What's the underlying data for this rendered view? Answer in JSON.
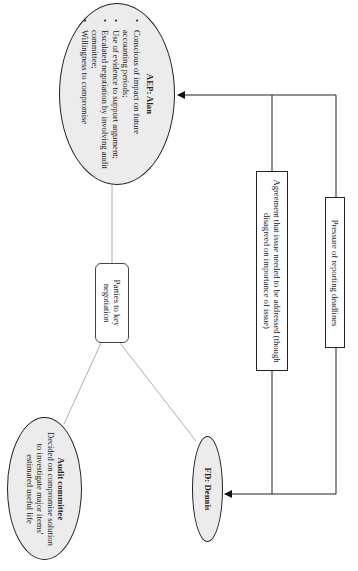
{
  "diagram": {
    "orientation": "rotated-90-clockwise",
    "central_node": {
      "label": "Parties to key negotiation"
    },
    "parties": {
      "aep": {
        "title": "AEP: Alan",
        "bullets": [
          "Conscious of impact on future accounting periods;",
          "Use of evidence to support argument;",
          "Escalated negotiation by involving audit committee;",
          "Willingness to compromise"
        ]
      },
      "audit_committee": {
        "title": "Audit committee",
        "text": "Decided on compromise solution to investigate major items' estimated useful life"
      },
      "fd": {
        "title": "FD: Dennis"
      }
    },
    "influences": [
      {
        "label": "Agreement that issue needed to be addressed (though disagreed on importance of issue)"
      },
      {
        "label": "Pressure of reporting deadlines"
      }
    ],
    "colors": {
      "ellipse_fill": "#ececec",
      "line": "#222222",
      "connector": "#888888"
    }
  }
}
